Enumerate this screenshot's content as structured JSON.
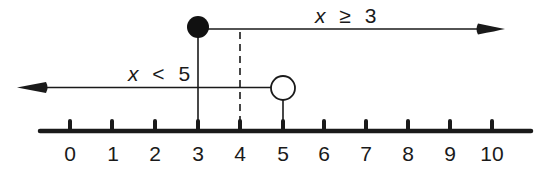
{
  "figure": {
    "type": "number-line",
    "axis": {
      "min": 0,
      "max": 10,
      "tick_labels": [
        "0",
        "1",
        "2",
        "3",
        "4",
        "5",
        "6",
        "7",
        "8",
        "9",
        "10"
      ]
    },
    "inequalities": [
      {
        "id": "upper",
        "variable": "x",
        "operator": "≥",
        "value": "3",
        "endpoint": 3,
        "endpoint_style": "closed",
        "direction": "right"
      },
      {
        "id": "lower",
        "variable": "x",
        "operator": "<",
        "value": "5",
        "endpoint": 5,
        "endpoint_style": "open",
        "direction": "left"
      }
    ],
    "marker": {
      "value": 4,
      "style": "dashed-vertical"
    },
    "colors": {
      "ink": "#1a1a1a",
      "background": "#ffffff"
    }
  }
}
